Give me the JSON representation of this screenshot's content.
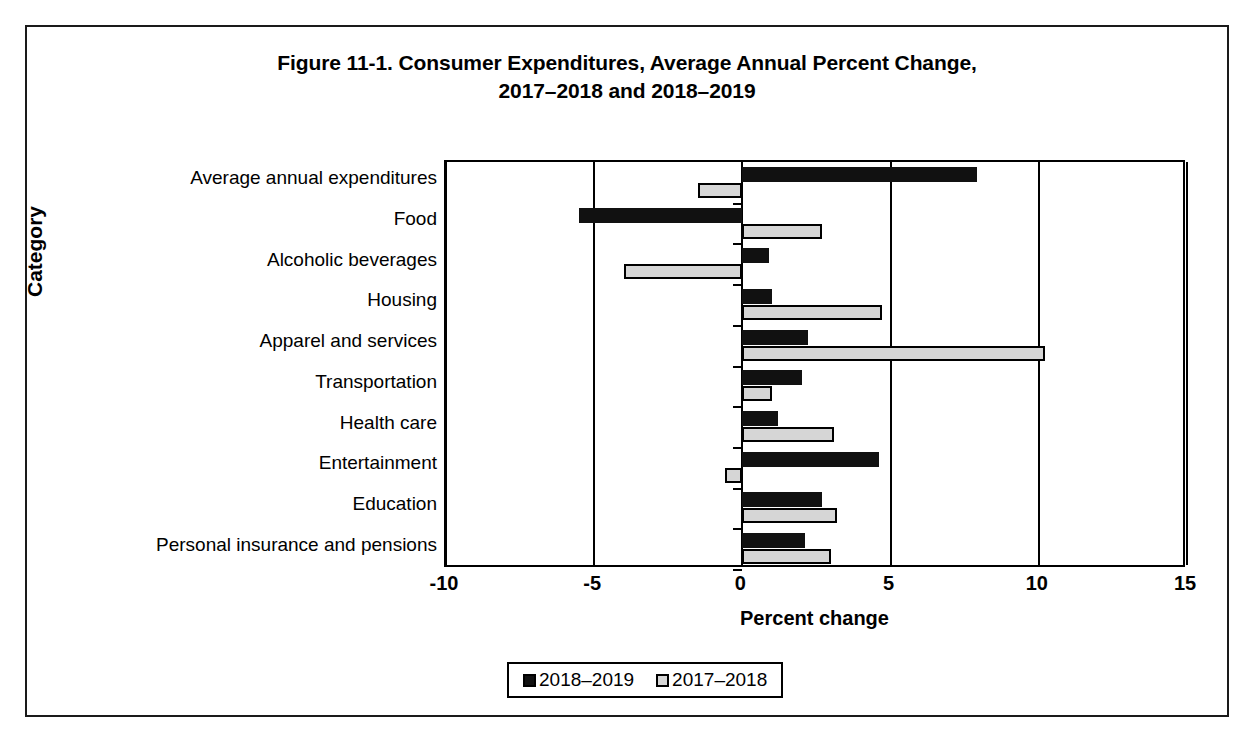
{
  "figure": {
    "title_line1": "Figure 11-1. Consumer Expenditures, Average Annual Percent Change,",
    "title_line2": "2017–2018 and 2018–2019"
  },
  "axes": {
    "y_title": "Category",
    "x_title": "Percent change",
    "x_ticks": [
      "-10",
      "-5",
      "0",
      "5",
      "10",
      "15"
    ]
  },
  "legend": {
    "items": [
      {
        "label": "2018–2019",
        "color": "#111111"
      },
      {
        "label": "2017–2018",
        "color": "#d6d6d6"
      }
    ]
  },
  "chart_data": {
    "type": "bar",
    "orientation": "horizontal",
    "title": "Figure 11-1. Consumer Expenditures, Average Annual Percent Change, 2017–2018 and 2018–2019",
    "xlabel": "Percent change",
    "ylabel": "Category",
    "xlim": [
      -10,
      15
    ],
    "xticks": [
      -10,
      -5,
      0,
      5,
      10,
      15
    ],
    "grid": true,
    "legend_position": "bottom",
    "categories": [
      "Average annual expenditures",
      "Food",
      "Alcoholic beverages",
      "Housing",
      "Apparel and services",
      "Transportation",
      "Health care",
      "Entertainment",
      "Education",
      "Personal insurance and pensions"
    ],
    "series": [
      {
        "name": "2018–2019",
        "color": "#111111",
        "values": [
          7.9,
          -5.5,
          0.9,
          1.0,
          2.2,
          2.0,
          1.2,
          4.6,
          2.7,
          2.1
        ]
      },
      {
        "name": "2017–2018",
        "color": "#d6d6d6",
        "values": [
          -1.5,
          2.7,
          -4.0,
          4.7,
          10.2,
          1.0,
          3.1,
          -0.6,
          3.2,
          3.0
        ]
      }
    ]
  }
}
